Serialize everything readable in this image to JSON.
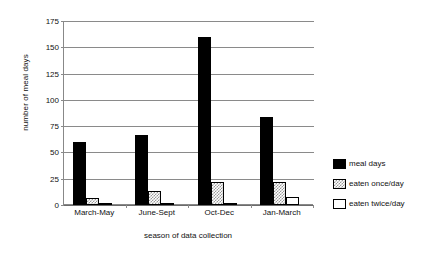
{
  "chart_data": {
    "type": "bar",
    "title": "",
    "xlabel": "season of data collection",
    "ylabel": "number of meal days",
    "categories": [
      "March-May",
      "June-Sept",
      "Oct-Dec",
      "Jan-March"
    ],
    "series": [
      {
        "name": "meal days",
        "values": [
          60,
          67,
          160,
          84
        ]
      },
      {
        "name": "eaten once/day",
        "values": [
          7,
          13,
          22,
          22
        ]
      },
      {
        "name": "eaten twice/day",
        "values": [
          2,
          1,
          1,
          8
        ]
      }
    ],
    "ylim": [
      0,
      175
    ],
    "yticks": [
      0,
      25,
      50,
      75,
      100,
      125,
      150,
      175
    ],
    "ytick_labels": [
      "0",
      "25",
      "50",
      "75",
      "100",
      "125",
      "150",
      "175"
    ],
    "grid": true,
    "legend_position": "right",
    "legend_entries": [
      "meal days",
      "eaten once/day",
      "eaten twice/day"
    ],
    "colors": {
      "meal days": "#000000",
      "eaten once/day": "#9a9a9a",
      "eaten twice/day": "#ffffff",
      "axis": "#8a8a8a",
      "text": "#111111",
      "background": "#ffffff"
    }
  }
}
